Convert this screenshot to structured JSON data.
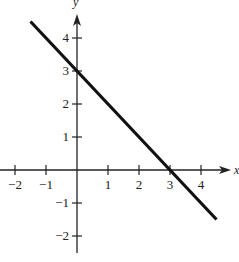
{
  "chart_data": {
    "type": "line",
    "title": "",
    "xlabel": "x",
    "ylabel": "y",
    "xlim": [
      -2,
      4.5
    ],
    "ylim": [
      -2.5,
      4.5
    ],
    "grid": false,
    "legend": null,
    "x_ticks": [
      -2,
      -1,
      1,
      2,
      3,
      4
    ],
    "x_tick_labels": [
      "−2",
      "−1",
      "1",
      "2",
      "3",
      "4"
    ],
    "y_ticks": [
      4,
      3,
      2,
      1,
      -1,
      -2
    ],
    "y_tick_labels": [
      "4",
      "3",
      "2",
      "1",
      "−1",
      "−2"
    ],
    "series": [
      {
        "name": "y = 3 - x",
        "x": [
          -1.5,
          4.5
        ],
        "y": [
          4.5,
          -1.5
        ],
        "color": "#111111",
        "intercepts": {
          "x": 3,
          "y": 3
        },
        "slope": -1
      }
    ]
  },
  "colors": {
    "axis": "#222222",
    "line": "#111111",
    "background": "#ffffff"
  }
}
